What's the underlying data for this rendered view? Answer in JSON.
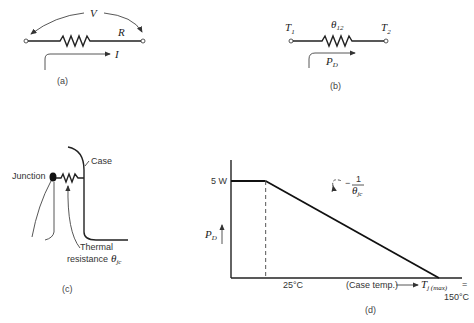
{
  "panels": {
    "a": {
      "caption": "(a)",
      "voltage_label": "V",
      "resistor_label": "R",
      "current_label": "I"
    },
    "b": {
      "caption": "(b)",
      "terminal_1": "T",
      "terminal_1_sub": "1",
      "terminal_2": "T",
      "terminal_2_sub": "2",
      "resistance_label": "θ",
      "resistance_sub": "12",
      "power_label": "P",
      "power_sub": "D"
    },
    "c": {
      "caption": "(c)",
      "junction_label": "Junction",
      "case_label": "Case",
      "thermal_line1": "Thermal",
      "thermal_line2": "resistance",
      "theta_label": "θ",
      "theta_sub": "jc"
    },
    "d": {
      "caption": "(d)",
      "y_tick": "5 W",
      "x_tick": "25°C",
      "y_axis_label": "P",
      "y_axis_sub": "D",
      "slope_num": "1",
      "slope_den": "θ",
      "slope_den_sub": "jc",
      "slope_prefix": "−",
      "x_axis_text": "(Case temp.)",
      "tmax_label": "T",
      "tmax_sub": "j (max)",
      "tmax_eq": "=",
      "tmax_value": "150°C"
    }
  },
  "chart_data": {
    "type": "line",
    "title": "",
    "xlabel": "Case temp.",
    "ylabel": "P_D",
    "series": [
      {
        "name": "P_D derating",
        "x": [
          0,
          25,
          150
        ],
        "y": [
          5,
          5,
          0
        ]
      }
    ],
    "x_ticks": [
      "25°C",
      "150°C"
    ],
    "y_ticks": [
      "5 W"
    ],
    "annotations": [
      "slope −1/θjc",
      "Tj(max) = 150°C"
    ],
    "xlim": [
      0,
      160
    ],
    "ylim": [
      0,
      6.4
    ],
    "grid": false
  }
}
